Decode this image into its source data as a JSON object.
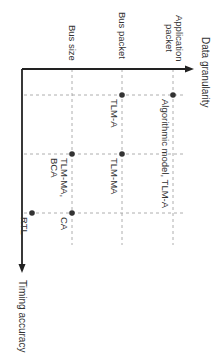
{
  "diagram": {
    "orientation": "rotated-90-clockwise",
    "colors": {
      "axis": "#222222",
      "grid": "#9a9a9a",
      "dot": "#333333",
      "text": "#333333"
    },
    "y_axis": {
      "label": "Data granularity",
      "levels": [
        {
          "label_line1": "Application",
          "label_line2": "packet"
        },
        {
          "label": "Bus packet"
        },
        {
          "label": "Bus size"
        }
      ]
    },
    "x_axis": {
      "label": "Timing accuracy"
    },
    "points": [
      {
        "label": "Algorithmic model, TLM-A",
        "granularity": "Application packet",
        "timing_col": 1
      },
      {
        "label": "TLM-A",
        "granularity": "Bus packet",
        "timing_col": 1
      },
      {
        "label": "TLM-MA",
        "granularity": "Bus packet",
        "timing_col": 2
      },
      {
        "label_line1": "TLM-MA,",
        "label_line2": "BCA",
        "granularity": "Bus size",
        "timing_col": 2
      },
      {
        "label": "CA",
        "granularity": "Bus size",
        "timing_col": 3
      },
      {
        "label": "RTL",
        "granularity": "below Bus size",
        "timing_col": 3
      }
    ]
  }
}
